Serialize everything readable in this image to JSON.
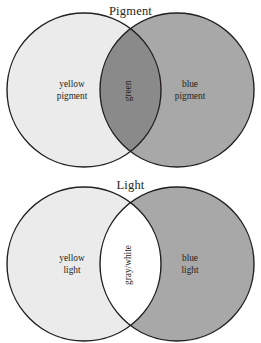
{
  "figures": [
    {
      "id": "pigment",
      "title": "Pigment",
      "left_circle": {
        "label_line1": "yellow",
        "label_line2": "pigment",
        "fill": "#ebebeb"
      },
      "right_circle": {
        "label_line1": "blue",
        "label_line2": "pigment",
        "fill": "#a8a8a8"
      },
      "overlap": {
        "label": "green",
        "fill": "#8a8a8a",
        "orientation": "vertical"
      },
      "stroke": "#231f20"
    },
    {
      "id": "light",
      "title": "Light",
      "left_circle": {
        "label_line1": "yellow",
        "label_line2": "light",
        "fill": "#ebebeb"
      },
      "right_circle": {
        "label_line1": "blue",
        "label_line2": "light",
        "fill": "#a8a8a8"
      },
      "overlap": {
        "label": "gray/white",
        "fill": "#ffffff",
        "orientation": "vertical"
      },
      "stroke": "#231f20"
    }
  ]
}
